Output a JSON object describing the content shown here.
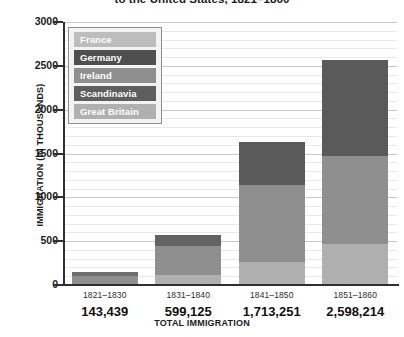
{
  "chart_data": {
    "type": "bar",
    "subtype": "stacked-bar",
    "title": "to the United States, 1821–1860",
    "xlabel": "TOTAL IMMIGRATION",
    "ylabel": "IMMIGRATION (IN THOUSANDS)",
    "ylim": [
      0,
      3000
    ],
    "yticks": [
      0,
      500,
      1000,
      1500,
      2000,
      2500,
      3000
    ],
    "ytick_labels": [
      "0",
      "500",
      "1000",
      "1500",
      "2000",
      "2500",
      "3000"
    ],
    "grid": true,
    "grid_minor_step": 100,
    "legend_position": "upper-left-inside",
    "categories": [
      "1821–1830",
      "1831–1840",
      "1841–1850",
      "1851–1860"
    ],
    "category_totals": [
      "143,439",
      "599,125",
      "1,713,251",
      "2,598,214"
    ],
    "series": [
      {
        "name": "Great Britain",
        "color": "#b8b8b8",
        "values": [
          25,
          75,
          267,
          424
        ]
      },
      {
        "name": "Scandinavia",
        "color": "#5e5e5e",
        "values": [
          0,
          0,
          13,
          21
        ]
      },
      {
        "name": "Ireland",
        "color": "#8f8f8f",
        "values": [
          51,
          207,
          781,
          914
        ]
      },
      {
        "name": "Germany",
        "color": "#4f4f4f",
        "values": [
          7,
          152,
          435,
          952
        ]
      },
      {
        "name": "France",
        "color": "#bdbdbd",
        "values": [
          8,
          45,
          77,
          76
        ]
      }
    ],
    "legend_entries": [
      {
        "label": "France",
        "color": "#bdbdbd"
      },
      {
        "label": "Germany",
        "color": "#4f4f4f"
      },
      {
        "label": "Ireland",
        "color": "#8f8f8f"
      },
      {
        "label": "Scandinavia",
        "color": "#5e5e5e"
      },
      {
        "label": "Great Britain",
        "color": "#b0b0b0"
      }
    ],
    "bars": [
      {
        "category": "1821–1830",
        "total_thousands": 143,
        "segments": [
          {
            "name": "Great Britain",
            "value": 100,
            "color": "#8f8f8f"
          },
          {
            "name": "Germany",
            "value": 43,
            "color": "#6e6e6e"
          }
        ]
      },
      {
        "category": "1831–1840",
        "total_thousands": 575,
        "segments": [
          {
            "name": "Great Britain",
            "value": 112,
            "color": "#b0b0b0"
          },
          {
            "name": "Ireland",
            "value": 330,
            "color": "#8f8f8f"
          },
          {
            "name": "Germany",
            "value": 133,
            "color": "#636363"
          }
        ]
      },
      {
        "category": "1841–1850",
        "total_thousands": 1634,
        "segments": [
          {
            "name": "Great Britain",
            "value": 262,
            "color": "#b0b0b0"
          },
          {
            "name": "Ireland",
            "value": 876,
            "color": "#8f8f8f"
          },
          {
            "name": "Germany",
            "value": 496,
            "color": "#5a5a5a"
          }
        ]
      },
      {
        "category": "1851–1860",
        "total_thousands": 2570,
        "segments": [
          {
            "name": "Great Britain",
            "value": 466,
            "color": "#b0b0b0"
          },
          {
            "name": "Ireland",
            "value": 1005,
            "color": "#8f8f8f"
          },
          {
            "name": "Germany",
            "value": 1099,
            "color": "#5a5a5a"
          }
        ]
      }
    ]
  }
}
